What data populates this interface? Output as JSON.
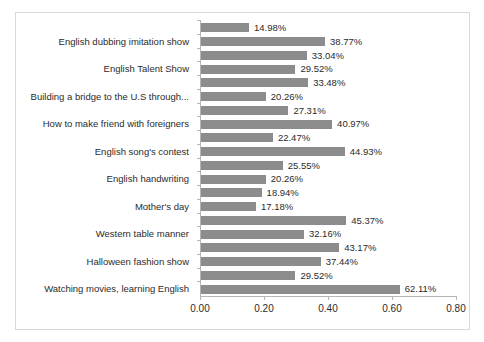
{
  "chart_data": {
    "type": "bar",
    "orientation": "horizontal",
    "title": "",
    "xlabel": "",
    "ylabel": "",
    "xlim": [
      0.0,
      0.8
    ],
    "grid": false,
    "legend": null,
    "bar_color": "#8c8c8c",
    "xticks": [
      "0.00",
      "0.20",
      "0.40",
      "0.60",
      "0.80"
    ],
    "xtick_values": [
      0.0,
      0.2,
      0.4,
      0.6,
      0.8
    ],
    "categories": [
      "English dubbing imitation show",
      "English Talent Show",
      "Building a bridge to the U.S through...",
      "How to make friend with foreigners",
      "English song's contest",
      "English handwriting",
      "Mother's day",
      "Western table manner",
      "Halloween fashion show",
      "Watching movies, learning English"
    ],
    "bars": [
      {
        "label": "14.98%",
        "value": 0.1498
      },
      {
        "label": "38.77%",
        "value": 0.3877
      },
      {
        "label": "33.04%",
        "value": 0.3304
      },
      {
        "label": "29.52%",
        "value": 0.2952
      },
      {
        "label": "33.48%",
        "value": 0.3348
      },
      {
        "label": "20.26%",
        "value": 0.2026
      },
      {
        "label": "27.31%",
        "value": 0.2731
      },
      {
        "label": "40.97%",
        "value": 0.4097
      },
      {
        "label": "22.47%",
        "value": 0.2247
      },
      {
        "label": "44.93%",
        "value": 0.4493
      },
      {
        "label": "25.55%",
        "value": 0.2555
      },
      {
        "label": "20.26%",
        "value": 0.2026
      },
      {
        "label": "18.94%",
        "value": 0.1894
      },
      {
        "label": "17.18%",
        "value": 0.1718
      },
      {
        "label": "45.37%",
        "value": 0.4537
      },
      {
        "label": "32.16%",
        "value": 0.3216
      },
      {
        "label": "43.17%",
        "value": 0.4317
      },
      {
        "label": "37.44%",
        "value": 0.3744
      },
      {
        "label": "29.52%",
        "value": 0.2952
      },
      {
        "label": "62.11%",
        "value": 0.6211
      }
    ]
  }
}
